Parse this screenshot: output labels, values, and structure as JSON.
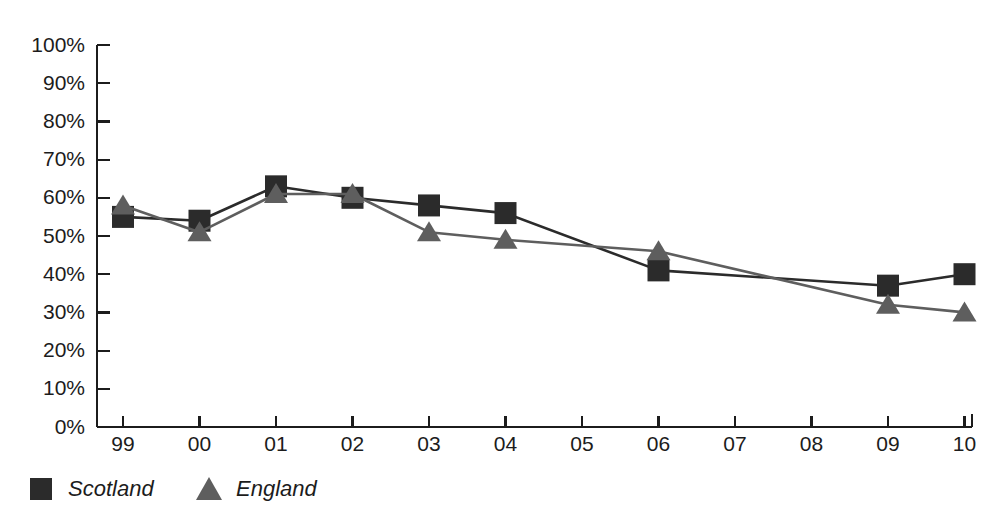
{
  "chart_data": {
    "type": "line",
    "title": "",
    "subtitle": "",
    "xlabel": "",
    "ylabel": "",
    "grid": false,
    "legend_position": "bottom-left",
    "categories": [
      "99",
      "00",
      "01",
      "02",
      "03",
      "04",
      "05",
      "06",
      "07",
      "08",
      "09",
      "10"
    ],
    "x_tick_labels": [
      "99",
      "00",
      "01",
      "02",
      "03",
      "04",
      "05",
      "06",
      "07",
      "08",
      "09",
      "10"
    ],
    "y_tick_labels": [
      "0%",
      "10%",
      "20%",
      "30%",
      "40%",
      "50%",
      "60%",
      "70%",
      "80%",
      "90%",
      "100%"
    ],
    "y_tick_values": [
      0,
      10,
      20,
      30,
      40,
      50,
      60,
      70,
      80,
      90,
      100
    ],
    "ylim": [
      0,
      100
    ],
    "y_unit": "%",
    "series": [
      {
        "name": "Scotland",
        "marker": "square",
        "color": "#2b2b2b",
        "values": [
          55,
          54,
          63,
          60,
          58,
          56,
          null,
          41,
          null,
          null,
          37,
          40
        ],
        "marker_years": [
          "99",
          "00",
          "01",
          "02",
          "03",
          "04",
          "06",
          "09",
          "10"
        ]
      },
      {
        "name": "England",
        "marker": "triangle",
        "color": "#5e5e5e",
        "values": [
          58,
          51,
          61,
          61,
          51,
          49,
          null,
          46,
          null,
          null,
          32,
          30
        ],
        "marker_years": [
          "99",
          "00",
          "01",
          "02",
          "03",
          "04",
          "06",
          "09",
          "10"
        ]
      }
    ]
  },
  "legend": {
    "items": [
      {
        "label": "Scotland",
        "marker": "square",
        "color": "#2b2b2b"
      },
      {
        "label": "England",
        "marker": "triangle",
        "color": "#5e5e5e"
      }
    ]
  },
  "colors": {
    "scotland": "#2b2b2b",
    "england": "#5e5e5e",
    "axis": "#1c1c1c",
    "background": "#ffffff"
  }
}
